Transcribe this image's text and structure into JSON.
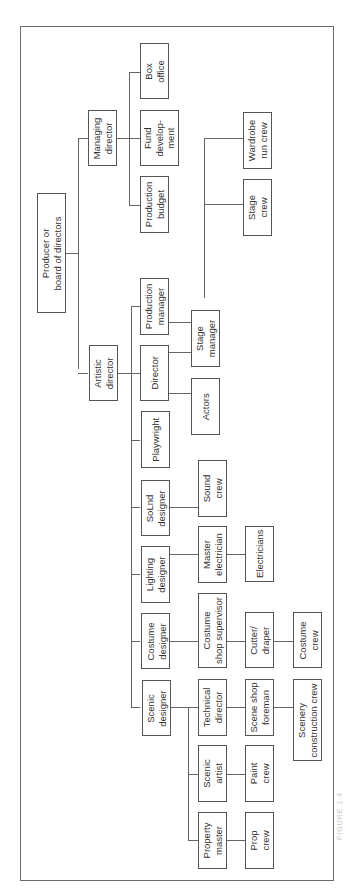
{
  "figure": {
    "caption": "FIGURE 1.4",
    "orientation": "rotated 90° counter-clockwise"
  },
  "nodes": {
    "producer": "Producer or\nboard of directors",
    "managing_director": "Managing\ndirector",
    "artistic_director": "Artistic\ndirector",
    "box_office": "Box\noffice",
    "fund_development": "Fund\ndevelop-\nment",
    "production_budget": "Production\nbudget",
    "production_manager": "Production\nmanager",
    "director": "Director",
    "playwright": "Playwright",
    "sound_designer": "SoLnd\ndesigner",
    "lighting_designer": "Lighting\ndesigner",
    "costume_designer": "Costume\ndesigner",
    "scenic_designer": "Scenic\ndesigner",
    "stage_manager": "Stage\nmanager",
    "actors": "Actors",
    "sound_crew": "Sound\ncrew",
    "master_electrician": "Master\nelectrician",
    "electricians": "Electricians",
    "costume_shop_supervisor": "Costume\nshop supervisor",
    "cutter_draper": "Cutter/\ndraper",
    "costume_crew": "Costume\ncrew",
    "technical_director": "Technical\ndirector",
    "scene_shop_foreman": "Scene shop\nforeman",
    "scenery_construction_crew": "Scenery\nconstruction crew",
    "scenic_artist": "Scenic\nartist",
    "paint_crew": "Paint\ncrew",
    "property_master": "Property\nmaster",
    "prop_crew": "Prop\ncrew",
    "wardrobe_run_crew": "Wardrobe\nrun crew",
    "stage_crew": "Stage\ncrew"
  },
  "hierarchy": {
    "Producer or board of directors": {
      "Managing director": [
        "Production budget",
        "Fund development",
        "Box office"
      ],
      "Artistic director": {
        "Production manager": [
          "Stage manager"
        ],
        "Director": [
          "Stage manager",
          "Actors"
        ],
        "Playwright": [],
        "Sound designer": [
          "Sound crew"
        ],
        "Lighting designer": {
          "Master electrician": [
            "Electricians"
          ]
        },
        "Costume designer": {
          "Costume shop supervisor": {
            "Cutter/draper": [
              "Costume crew"
            ]
          }
        },
        "Scenic designer": {
          "Technical director": {
            "Scene shop foreman": [
              "Scenery construction crew"
            ]
          },
          "Scenic artist": [
            "Paint crew"
          ],
          "Property master": [
            "Prop crew"
          ]
        }
      }
    },
    "Stage manager": [
      "Stage crew",
      "Wardrobe run crew"
    ]
  }
}
